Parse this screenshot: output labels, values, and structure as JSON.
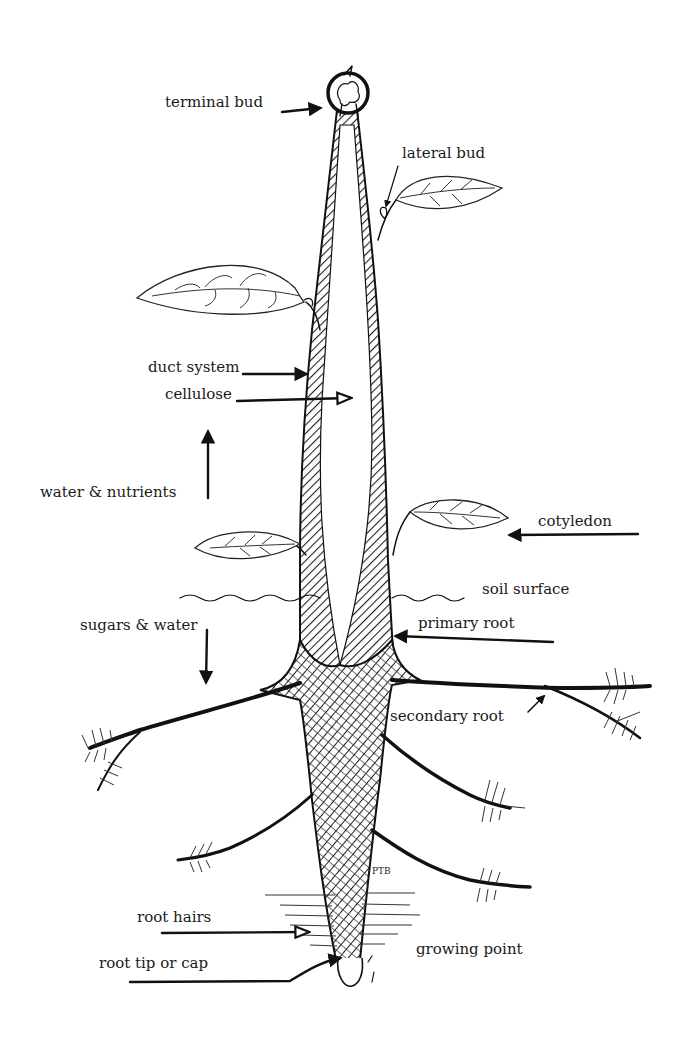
{
  "diagram": {
    "labels": {
      "terminal_bud": "terminal bud",
      "lateral_bud": "lateral bud",
      "duct_system": "duct system",
      "cellulose": "cellulose",
      "water_nutrients": "water & nutrients",
      "cotyledon": "cotyledon",
      "soil_surface": "soil surface",
      "sugars_water": "sugars & water",
      "primary_root": "primary  root",
      "secondary_root": "secondary  root",
      "root_hairs": "root hairs",
      "root_tip": "root tip or cap",
      "growing_point": "growing point"
    },
    "signature": "PTB",
    "colors": {
      "ink": "#111111",
      "background": "#ffffff"
    }
  }
}
